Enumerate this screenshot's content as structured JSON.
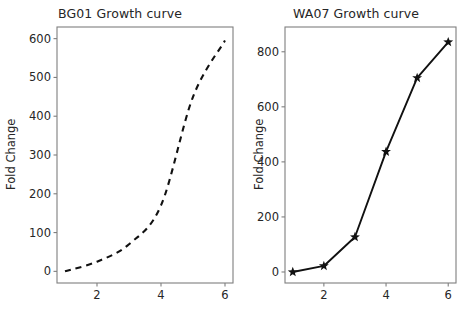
{
  "figure": {
    "background": "#ffffff",
    "line_color": "#111111",
    "axis_color": "#7f7f7f",
    "tick_label_color": "#262626"
  },
  "panels": [
    {
      "id": "bg01",
      "title": "BG01 Growth curve",
      "ylabel": "Fold Change",
      "xlabel": ""
    },
    {
      "id": "wa07",
      "title": "WA07 Growth curve",
      "ylabel": "Fold Change",
      "xlabel": ""
    }
  ],
  "chart_data": [
    {
      "type": "line",
      "title": "BG01 Growth curve",
      "xlabel": "",
      "ylabel": "Fold Change",
      "x": [
        1,
        2,
        3,
        4,
        5,
        6
      ],
      "values": [
        0,
        25,
        70,
        170,
        450,
        595
      ],
      "series": [
        {
          "name": "BG01",
          "values": [
            0,
            25,
            70,
            170,
            450,
            595
          ]
        }
      ],
      "xlim": [
        0.75,
        6.25
      ],
      "ylim": [
        -30,
        630
      ],
      "xticks": [
        2,
        4,
        6
      ],
      "xticklabels": [
        "2",
        "4",
        "6"
      ],
      "yticks": [
        0,
        100,
        200,
        300,
        400,
        500,
        600
      ],
      "yticklabels": [
        "0",
        "100",
        "200",
        "300",
        "400",
        "500",
        "600"
      ],
      "linestyle": "dashed",
      "marker": "none",
      "grid": false,
      "legend": false
    },
    {
      "type": "line",
      "title": "WA07 Growth curve",
      "xlabel": "",
      "ylabel": "Fold Change",
      "x": [
        1,
        2,
        3,
        4,
        5,
        6
      ],
      "values": [
        0,
        22,
        127,
        437,
        705,
        835
      ],
      "series": [
        {
          "name": "WA07",
          "values": [
            0,
            22,
            127,
            437,
            705,
            835
          ]
        }
      ],
      "xlim": [
        0.75,
        6.25
      ],
      "ylim": [
        -40,
        890
      ],
      "xticks": [
        2,
        4,
        6
      ],
      "xticklabels": [
        "2",
        "4",
        "6"
      ],
      "yticks": [
        0,
        200,
        400,
        600,
        800
      ],
      "yticklabels": [
        "0",
        "200",
        "400",
        "600",
        "800"
      ],
      "linestyle": "solid",
      "marker": "star",
      "grid": false,
      "legend": false
    }
  ]
}
